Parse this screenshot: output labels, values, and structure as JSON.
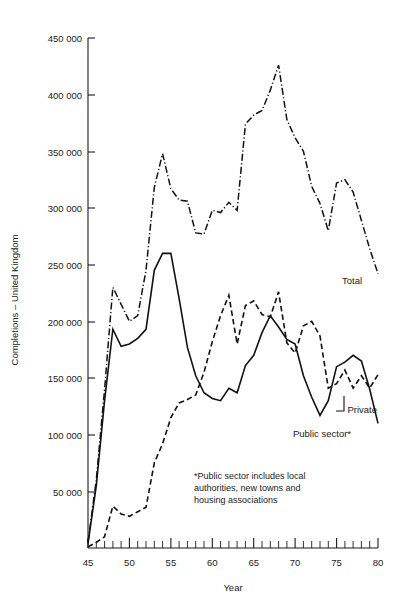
{
  "chart_data": {
    "type": "line",
    "title": "",
    "xlabel": "Year",
    "ylabel": "Completions – United Kingdom",
    "xlim": [
      45,
      80
    ],
    "ylim": [
      0,
      450000
    ],
    "grid": false,
    "legend_position": "inline-labels",
    "x_ticks_major": [
      45,
      50,
      55,
      60,
      65,
      70,
      75,
      80
    ],
    "x_tick_labels": [
      "45",
      "50",
      "55",
      "60",
      "65",
      "70",
      "75",
      "80"
    ],
    "x_minor_step": 1,
    "y_ticks": [
      50000,
      100000,
      150000,
      200000,
      250000,
      300000,
      350000,
      400000,
      450000
    ],
    "y_tick_labels": [
      "50 000",
      "100 000",
      "150 000",
      "200 000",
      "250 000",
      "300 000",
      "350 000",
      "400 000",
      "450 000"
    ],
    "x": [
      45,
      46,
      47,
      48,
      49,
      50,
      51,
      52,
      53,
      54,
      55,
      56,
      57,
      58,
      59,
      60,
      61,
      62,
      63,
      64,
      65,
      66,
      67,
      68,
      69,
      70,
      71,
      72,
      73,
      74,
      75,
      76,
      77,
      78,
      79,
      80
    ],
    "series": [
      {
        "name": "Total",
        "style": "dash-dot",
        "label": "Total",
        "values": [
          5000,
          60000,
          140000,
          230000,
          215000,
          200000,
          205000,
          245000,
          318000,
          348000,
          317000,
          307000,
          306000,
          278000,
          277000,
          298000,
          296000,
          305000,
          298000,
          374000,
          382000,
          386000,
          404000,
          426000,
          378000,
          362000,
          350000,
          319000,
          304000,
          280000,
          322000,
          325000,
          314000,
          289000,
          264000,
          242000
        ]
      },
      {
        "name": "Public sector*",
        "style": "solid",
        "label": "Public sector*",
        "values": [
          4000,
          55000,
          130000,
          193000,
          178000,
          180000,
          185000,
          193000,
          245000,
          260000,
          260000,
          220000,
          177000,
          152000,
          137000,
          132000,
          130000,
          141000,
          137000,
          161000,
          170000,
          190000,
          205000,
          195000,
          184000,
          180000,
          152000,
          133000,
          117000,
          130000,
          160000,
          164000,
          170000,
          165000,
          140000,
          110000
        ]
      },
      {
        "name": "Private",
        "style": "dashed",
        "label": "Private",
        "values": [
          1000,
          5000,
          10000,
          37000,
          30000,
          28000,
          32000,
          36000,
          75000,
          92000,
          115000,
          128000,
          131000,
          135000,
          155000,
          182000,
          205000,
          223000,
          180000,
          214000,
          218000,
          206000,
          204000,
          226000,
          181000,
          172000,
          196000,
          200000,
          187000,
          141000,
          145000,
          157000,
          141000,
          152000,
          141000,
          153000
        ]
      }
    ],
    "annotations": [
      {
        "name": "public-sector-footnote",
        "text_lines": [
          "*Public sector includes local",
          "authorities, new towns and",
          "housing associations"
        ]
      }
    ]
  },
  "labels": {
    "y_axis_title": "Completions – United Kingdom",
    "x_axis_title": "Year",
    "total": "Total",
    "private": "Private",
    "public_sector": "Public sector*",
    "footnote_line1": "*Public sector includes local",
    "footnote_line2": "authorities, new towns and",
    "footnote_line3": "housing associations"
  },
  "ytick": {
    "t450": "450 000",
    "t400": "400 000",
    "t350": "350 000",
    "t300": "300 000",
    "t250": "250 000",
    "t200": "200 000",
    "t150": "150 000",
    "t100": "100 000",
    "t50": "50 000"
  },
  "xtick": {
    "t45": "45",
    "t50": "50",
    "t55": "55",
    "t60": "60",
    "t65": "65",
    "t70": "70",
    "t75": "75",
    "t80": "80"
  },
  "colors": {
    "ink": "#1a1a1a",
    "line": "#111111",
    "background": "#ffffff"
  }
}
